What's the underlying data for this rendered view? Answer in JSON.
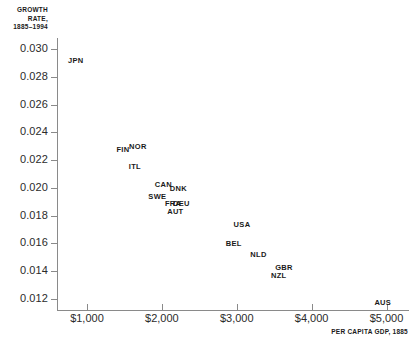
{
  "chart_data": {
    "type": "scatter",
    "title": "",
    "xlabel": "PER CAPITA GDP, 1885",
    "ylabel": "GROWTH RATE, 1885–1994",
    "ylabel_lines": [
      "GROWTH",
      "RATE,",
      "1885–1994"
    ],
    "xlim": [
      600,
      5300
    ],
    "ylim": [
      0.0112,
      0.0308
    ],
    "grid": false,
    "legend": "none",
    "marker_style": "text-label-only",
    "xticks": [
      1000,
      2000,
      3000,
      4000,
      5000
    ],
    "xtick_labels": [
      "$1,000",
      "$2,000",
      "$3,000",
      "$4,000",
      "$5,000"
    ],
    "yticks": [
      0.012,
      0.014,
      0.016,
      0.018,
      0.02,
      0.022,
      0.024,
      0.026,
      0.028,
      0.03
    ],
    "ytick_labels": [
      "0.012",
      "0.014",
      "0.016",
      "0.018",
      "0.020",
      "0.022",
      "0.024",
      "0.026",
      "0.028",
      "0.030"
    ],
    "points": [
      {
        "label": "JPN",
        "x": 850,
        "y": 0.0292
      },
      {
        "label": "FIN",
        "x": 1480,
        "y": 0.0228
      },
      {
        "label": "NOR",
        "x": 1680,
        "y": 0.023
      },
      {
        "label": "ITL",
        "x": 1640,
        "y": 0.0216
      },
      {
        "label": "CAN",
        "x": 2020,
        "y": 0.0203
      },
      {
        "label": "DNK",
        "x": 2220,
        "y": 0.02
      },
      {
        "label": "SWE",
        "x": 1940,
        "y": 0.0194
      },
      {
        "label": "FRA",
        "x": 2150,
        "y": 0.0189
      },
      {
        "label": "DEU",
        "x": 2260,
        "y": 0.0189
      },
      {
        "label": "AUT",
        "x": 2180,
        "y": 0.0183
      },
      {
        "label": "USA",
        "x": 3070,
        "y": 0.0174
      },
      {
        "label": "BEL",
        "x": 2960,
        "y": 0.016
      },
      {
        "label": "NLD",
        "x": 3290,
        "y": 0.0152
      },
      {
        "label": "GBR",
        "x": 3630,
        "y": 0.0143
      },
      {
        "label": "NZL",
        "x": 3560,
        "y": 0.0137
      },
      {
        "label": "AUS",
        "x": 4950,
        "y": 0.0118
      }
    ]
  }
}
